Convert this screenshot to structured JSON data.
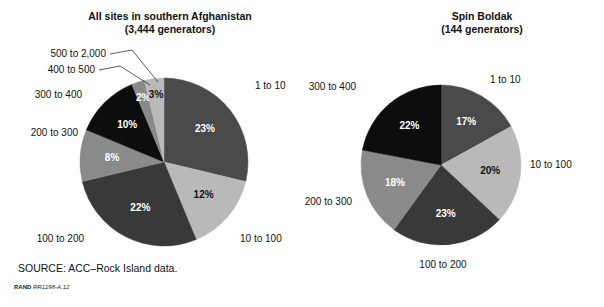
{
  "figure": {
    "source_note": "SOURCE: ACC–Rock Island data.",
    "credit_org": "RAND",
    "credit_number": "RR1298-A.12",
    "background": "#ffffff"
  },
  "palette": {
    "dark_gray": "#4a4a4a",
    "light_gray": "#b9b9b9",
    "darker_gray": "#393939",
    "mid_gray": "#8a8a8a",
    "black": "#0d0d0d"
  },
  "chart_data": [
    {
      "type": "pie",
      "id": "all-sites",
      "title": "All sites in southern Afghanistan",
      "subtitle": "(3,444 generators)",
      "total_label": "3,444 generators",
      "total": 3444,
      "start_angle_deg": 0,
      "direction": "clockwise",
      "center": [
        164,
        162
      ],
      "radius": 84,
      "categories": [
        "1 to 10",
        "10 to 100",
        "100 to 200",
        "200 to 300",
        "300 to 400",
        "400 to 500",
        "500 to 2,000"
      ],
      "values": [
        23,
        12,
        22,
        8,
        10,
        2,
        3
      ],
      "value_labels": [
        "23%",
        "12%",
        "22%",
        "8%",
        "10%",
        "2%",
        "3%"
      ],
      "slice_colors": [
        "#4a4a4a",
        "#b9b9b9",
        "#393939",
        "#8a8a8a",
        "#0d0d0d",
        "#8a8a8a",
        "#b9b9b9"
      ],
      "label_colors": [
        "#ffffff",
        "#111111",
        "#ffffff",
        "#ffffff",
        "#ffffff",
        "#ffffff",
        "#111111"
      ],
      "outer_labels": [
        {
          "text": "1 to 10",
          "x": 255,
          "y": 86,
          "anchor": "start",
          "leader": false
        },
        {
          "text": "10 to 100",
          "x": 240,
          "y": 239,
          "anchor": "start",
          "leader": false
        },
        {
          "text": "100 to 200",
          "x": 84,
          "y": 239,
          "anchor": "end",
          "leader": false
        },
        {
          "text": "200 to 300",
          "x": 78,
          "y": 133,
          "anchor": "end",
          "leader": false
        },
        {
          "text": "300 to 400",
          "x": 82,
          "y": 95,
          "anchor": "end",
          "leader": false
        },
        {
          "text": "400 to 500",
          "x": 95,
          "y": 70,
          "anchor": "end",
          "leader": true
        },
        {
          "text": "500 to 2,000",
          "x": 106,
          "y": 54,
          "anchor": "end",
          "leader": true
        }
      ],
      "leaders": [
        {
          "x1": 99,
          "y1": 70,
          "x2": 120,
          "y2": 66,
          "x3": 150,
          "y3": 85
        },
        {
          "x1": 110,
          "y1": 54,
          "x2": 132,
          "y2": 50,
          "x3": 158,
          "y3": 82
        }
      ],
      "legend_position": "outside-callouts",
      "grid": false
    },
    {
      "type": "pie",
      "id": "spin-boldak",
      "title": "Spin Boldak",
      "subtitle": "(144 generators)",
      "total_label": "144 generators",
      "total": 144,
      "start_angle_deg": 0,
      "direction": "clockwise",
      "center": [
        441,
        165
      ],
      "radius": 80,
      "categories": [
        "1 to 10",
        "10 to 100",
        "100 to 200",
        "200 to 300",
        "300 to 400"
      ],
      "values": [
        17,
        20,
        23,
        18,
        22
      ],
      "value_labels": [
        "17%",
        "20%",
        "23%",
        "18%",
        "22%"
      ],
      "slice_colors": [
        "#4a4a4a",
        "#b9b9b9",
        "#393939",
        "#8a8a8a",
        "#0d0d0d"
      ],
      "label_colors": [
        "#ffffff",
        "#111111",
        "#ffffff",
        "#ffffff",
        "#ffffff"
      ],
      "outer_labels": [
        {
          "text": "1 to 10",
          "x": 490,
          "y": 80,
          "anchor": "start",
          "leader": false
        },
        {
          "text": "10 to 100",
          "x": 530,
          "y": 165,
          "anchor": "start",
          "leader": false
        },
        {
          "text": "100 to 200",
          "x": 443,
          "y": 265,
          "anchor": "middle",
          "leader": false
        },
        {
          "text": "200 to 300",
          "x": 352,
          "y": 202,
          "anchor": "end",
          "leader": false
        },
        {
          "text": "300 to 400",
          "x": 356,
          "y": 87,
          "anchor": "end",
          "leader": false
        }
      ],
      "leaders": [],
      "legend_position": "outside-callouts",
      "grid": false
    }
  ]
}
